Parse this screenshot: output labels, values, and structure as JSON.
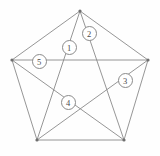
{
  "figure": {
    "shape_name": "pentagon",
    "inner_shape_name": "pentagram",
    "background_color": "#fefefe",
    "line_color": "#8a8a8a",
    "label_text_color": "#4a4a4a",
    "vertex_count": 5,
    "diagonal_count": 5,
    "vertices": [
      {
        "name": "top",
        "x": 80,
        "y": 11
      },
      {
        "name": "right",
        "x": 148,
        "y": 60
      },
      {
        "name": "bottom-right",
        "x": 124,
        "y": 140
      },
      {
        "name": "bottom-left",
        "x": 37,
        "y": 140
      },
      {
        "name": "left",
        "x": 12,
        "y": 60
      }
    ],
    "edges": [
      {
        "name": "edge-top-right",
        "from": 0,
        "to": 1
      },
      {
        "name": "edge-right-bottomright",
        "from": 1,
        "to": 2
      },
      {
        "name": "edge-bottom",
        "from": 2,
        "to": 3
      },
      {
        "name": "edge-bottomleft-left",
        "from": 3,
        "to": 4
      },
      {
        "name": "edge-left-top",
        "from": 4,
        "to": 0
      }
    ],
    "diagonals": [
      {
        "name": "diagonal-top-bottomright",
        "from": 0,
        "to": 2
      },
      {
        "name": "diagonal-top-bottomleft",
        "from": 0,
        "to": 3
      },
      {
        "name": "diagonal-right-bottomleft",
        "from": 1,
        "to": 3
      },
      {
        "name": "diagonal-right-left",
        "from": 1,
        "to": 4
      },
      {
        "name": "diagonal-bottomright-left",
        "from": 2,
        "to": 4
      }
    ],
    "labels": [
      {
        "id": "label-1",
        "text": "1",
        "x": 69,
        "y": 47
      },
      {
        "id": "label-2",
        "text": "2",
        "x": 89,
        "y": 33
      },
      {
        "id": "label-3",
        "text": "3",
        "x": 125,
        "y": 80
      },
      {
        "id": "label-4",
        "text": "4",
        "x": 68,
        "y": 102
      },
      {
        "id": "label-5",
        "text": "5",
        "x": 39,
        "y": 61
      }
    ]
  }
}
